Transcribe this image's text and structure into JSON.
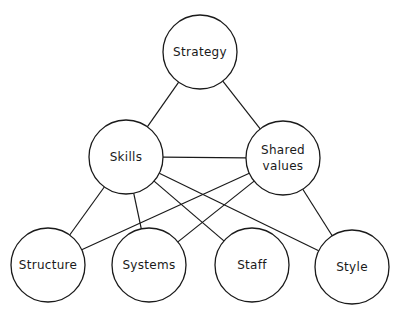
{
  "diagram": {
    "title": "",
    "stroke_color": "#1a1a1a",
    "background": "#ffffff",
    "nodes": [
      {
        "id": "strategy",
        "label": "Strategy",
        "lines": [
          "Strategy"
        ],
        "cx": 200,
        "cy": 52,
        "r": 37
      },
      {
        "id": "skills",
        "label": "Skills",
        "lines": [
          "Skills"
        ],
        "cx": 126,
        "cy": 157,
        "r": 37
      },
      {
        "id": "shared_values",
        "label": "Shared values",
        "lines": [
          "Shared",
          "values"
        ],
        "cx": 283,
        "cy": 158,
        "r": 37
      },
      {
        "id": "structure",
        "label": "Structure",
        "lines": [
          "Structure"
        ],
        "cx": 48,
        "cy": 265,
        "r": 37
      },
      {
        "id": "systems",
        "label": "Systems",
        "lines": [
          "Systems"
        ],
        "cx": 149,
        "cy": 265,
        "r": 37
      },
      {
        "id": "staff",
        "label": "Staff",
        "lines": [
          "Staff"
        ],
        "cx": 252,
        "cy": 265,
        "r": 37
      },
      {
        "id": "style",
        "label": "Style",
        "lines": [
          "Style"
        ],
        "cx": 352,
        "cy": 267,
        "r": 37
      }
    ],
    "edges": [
      {
        "from": "strategy",
        "to": "skills"
      },
      {
        "from": "strategy",
        "to": "shared_values"
      },
      {
        "from": "skills",
        "to": "shared_values"
      },
      {
        "from": "skills",
        "to": "structure"
      },
      {
        "from": "skills",
        "to": "systems"
      },
      {
        "from": "skills",
        "to": "staff"
      },
      {
        "from": "skills",
        "to": "style"
      },
      {
        "from": "shared_values",
        "to": "structure"
      },
      {
        "from": "shared_values",
        "to": "systems"
      },
      {
        "from": "shared_values",
        "to": "style"
      }
    ]
  }
}
